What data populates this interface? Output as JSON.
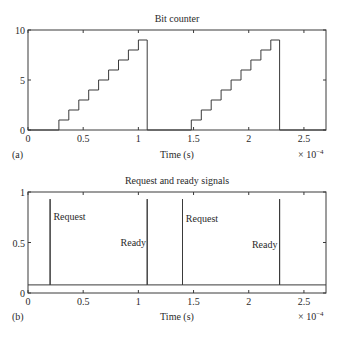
{
  "chart_data": [
    {
      "type": "line",
      "style": "stairs",
      "title": "Bit counter",
      "panel_label": "(a)",
      "xlabel": "Time (s)",
      "ylabel": "",
      "x_multiplier_label": "× 10",
      "x_multiplier_exp": "−4",
      "xlim": [
        0,
        2.7
      ],
      "ylim": [
        0,
        10
      ],
      "xticks": [
        0,
        0.5,
        1,
        1.5,
        2,
        2.5
      ],
      "xtick_labels": [
        "0",
        "0.5",
        "1",
        "1.5",
        "2",
        "2.5"
      ],
      "yticks": [
        0,
        5,
        10
      ],
      "ytick_labels": [
        "0",
        "5",
        "10"
      ],
      "grid": false,
      "series": [
        {
          "name": "bit count",
          "x": [
            0,
            0.28,
            0.28,
            0.37,
            0.37,
            0.46,
            0.46,
            0.55,
            0.55,
            0.64,
            0.64,
            0.73,
            0.73,
            0.82,
            0.82,
            0.91,
            0.91,
            1.0,
            1.0,
            1.08,
            1.08,
            1.48,
            1.48,
            1.57,
            1.57,
            1.66,
            1.66,
            1.75,
            1.75,
            1.84,
            1.84,
            1.93,
            1.93,
            2.02,
            2.02,
            2.11,
            2.11,
            2.2,
            2.2,
            2.28,
            2.28,
            2.7
          ],
          "y": [
            0,
            0,
            1,
            1,
            2,
            2,
            3,
            3,
            4,
            4,
            5,
            5,
            6,
            6,
            7,
            7,
            8,
            8,
            9,
            9,
            0,
            0,
            1,
            1,
            2,
            2,
            3,
            3,
            4,
            4,
            5,
            5,
            6,
            6,
            7,
            7,
            8,
            8,
            9,
            9,
            0,
            0
          ]
        }
      ]
    },
    {
      "type": "line",
      "title": "Request and ready signals",
      "panel_label": "(b)",
      "xlabel": "Time (s)",
      "ylabel": "",
      "x_multiplier_label": "× 10",
      "x_multiplier_exp": "−4",
      "xlim": [
        0,
        2.7
      ],
      "ylim": [
        0,
        1
      ],
      "xticks": [
        0,
        0.5,
        1,
        1.5,
        2,
        2.5
      ],
      "xtick_labels": [
        "0",
        "0.5",
        "1",
        "1.5",
        "2",
        "2.5"
      ],
      "yticks": [
        0,
        0.5,
        1
      ],
      "ytick_labels": [
        "0",
        "0.5",
        "1"
      ],
      "grid": false,
      "baseline": 0.08,
      "series": [
        {
          "name": "signals",
          "x": [
            0,
            0.2,
            0.2,
            0.2,
            1.08,
            1.08,
            1.08,
            1.4,
            1.4,
            1.4,
            2.28,
            2.28,
            2.28,
            2.7
          ],
          "y": [
            0.08,
            0.08,
            0.93,
            0.08,
            0.08,
            0.93,
            0.08,
            0.08,
            0.93,
            0.08,
            0.08,
            0.93,
            0.08,
            0.08
          ]
        }
      ],
      "annotations": [
        {
          "text": "Request",
          "x": 0.23,
          "y": 0.72,
          "align": "left"
        },
        {
          "text": "Ready",
          "x": 1.07,
          "y": 0.47,
          "align": "right"
        },
        {
          "text": "Request",
          "x": 1.43,
          "y": 0.7,
          "align": "left"
        },
        {
          "text": "Ready",
          "x": 2.26,
          "y": 0.45,
          "align": "right"
        }
      ]
    }
  ]
}
